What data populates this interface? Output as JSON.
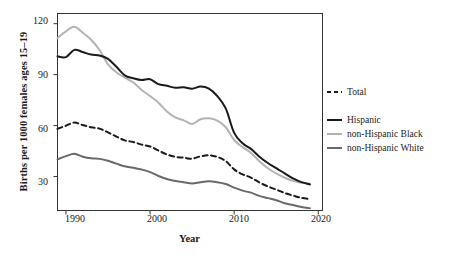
{
  "chart_data": {
    "type": "line",
    "title": "",
    "xlabel": "Year",
    "ylabel": "Births per 1000 females ages 15–19",
    "xlim": [
      1989,
      2020.5
    ],
    "ylim": [
      10,
      126
    ],
    "grid": false,
    "legend_position": "right",
    "xticks": [
      1990,
      2000,
      2010,
      2020
    ],
    "xtick_labels": [
      "1990",
      "2000",
      "2010",
      "2020"
    ],
    "yticks": [
      30,
      60,
      90,
      120
    ],
    "ytick_labels": [
      "30",
      "60",
      "90",
      "120"
    ],
    "x": [
      1989,
      1990,
      1991,
      1992,
      1993,
      1994,
      1995,
      1996,
      1997,
      1998,
      1999,
      2000,
      2001,
      2002,
      2003,
      2004,
      2005,
      2006,
      2007,
      2008,
      2009,
      2010,
      2011,
      2012,
      2013,
      2014,
      2015,
      2016,
      2017,
      2018,
      2019
    ],
    "series": [
      {
        "name": "Total",
        "style": "dashed",
        "color": "#1a1a1a",
        "width": 2.0,
        "values": [
          58.1,
          59.9,
          61.8,
          60.3,
          59.0,
          58.2,
          56.0,
          53.5,
          51.3,
          50.3,
          48.8,
          47.7,
          45.3,
          43.0,
          41.6,
          41.1,
          40.5,
          41.9,
          42.5,
          41.5,
          39.1,
          34.2,
          31.3,
          29.4,
          26.5,
          24.2,
          22.3,
          20.3,
          18.8,
          17.4,
          16.7
        ]
      },
      {
        "name": "Hispanic",
        "style": "solid",
        "color": "#1a1a1a",
        "width": 2.0,
        "values": [
          100.8,
          100.3,
          104.6,
          103.3,
          101.8,
          101.3,
          99.3,
          94.6,
          89.6,
          87.9,
          86.8,
          87.3,
          84.4,
          83.4,
          82.3,
          82.6,
          81.7,
          83.0,
          81.8,
          77.4,
          70.1,
          55.7,
          49.6,
          46.3,
          41.7,
          38.0,
          34.9,
          31.9,
          28.9,
          26.7,
          25.3
        ]
      },
      {
        "name": "non-Hispanic Black",
        "style": "solid",
        "color": "#b3b3b3",
        "width": 2.0,
        "values": [
          111.5,
          115.5,
          118.2,
          114.7,
          110.5,
          104.5,
          96.1,
          91.4,
          88.2,
          85.4,
          81.0,
          77.4,
          73.5,
          68.3,
          64.8,
          63.1,
          60.9,
          63.7,
          64.3,
          62.9,
          59.0,
          51.5,
          47.3,
          43.9,
          39.0,
          34.9,
          31.8,
          29.3,
          27.5,
          26.3,
          25.8
        ]
      },
      {
        "name": "non-Hispanic White",
        "style": "solid",
        "color": "#696969",
        "width": 2.0,
        "values": [
          40.1,
          42.0,
          43.4,
          41.7,
          40.7,
          40.4,
          39.3,
          37.6,
          36.0,
          35.2,
          34.1,
          32.6,
          30.3,
          28.5,
          27.4,
          26.7,
          25.9,
          26.7,
          27.2,
          26.7,
          25.6,
          23.5,
          21.7,
          20.5,
          18.6,
          17.3,
          16.0,
          14.3,
          13.2,
          12.1,
          11.4
        ]
      }
    ]
  },
  "legend": {
    "items": [
      {
        "label": "Total"
      },
      {
        "label": "Hispanic"
      },
      {
        "label": "non-Hispanic Black"
      },
      {
        "label": "non-Hispanic White"
      }
    ]
  }
}
